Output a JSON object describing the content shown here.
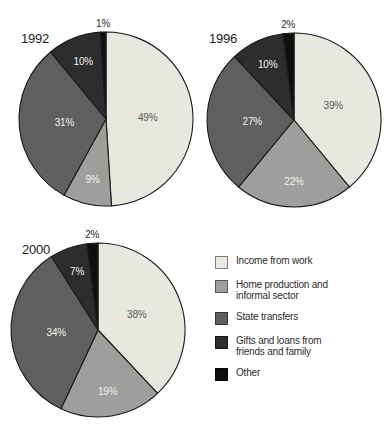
{
  "palette": [
    "#e9e8e0",
    "#9e9e9c",
    "#5f5f5f",
    "#2d2d2d",
    "#0f0f0f"
  ],
  "slice_label_colors": [
    "#59595b",
    "#f2f2ec",
    "#f2f2ec",
    "#f2f2ec",
    "#2b2b2b"
  ],
  "chart_data": [
    {
      "type": "pie",
      "title": "1992",
      "categories": [
        "Income from work",
        "Home production and informal sector",
        "State transfers",
        "Gifts and loans from friends and family",
        "Other"
      ],
      "values": [
        49,
        9,
        31,
        10,
        1
      ],
      "unit": "%",
      "labels": [
        "49%",
        "9%",
        "31%",
        "10%",
        "1%"
      ],
      "start_angle_deg": -90,
      "direction": "clockwise"
    },
    {
      "type": "pie",
      "title": "1996",
      "categories": [
        "Income from work",
        "Home production and informal sector",
        "State transfers",
        "Gifts and loans from friends and family",
        "Other"
      ],
      "values": [
        39,
        22,
        27,
        10,
        2
      ],
      "unit": "%",
      "labels": [
        "39%",
        "22%",
        "27%",
        "10%",
        "2%"
      ],
      "start_angle_deg": -90,
      "direction": "clockwise"
    },
    {
      "type": "pie",
      "title": "2000",
      "categories": [
        "Income from work",
        "Home production and informal sector",
        "State transfers",
        "Gifts and loans from friends and family",
        "Other"
      ],
      "values": [
        38,
        19,
        34,
        7,
        2
      ],
      "unit": "%",
      "labels": [
        "38%",
        "19%",
        "34%",
        "7%",
        "2%"
      ],
      "start_angle_deg": -90,
      "direction": "clockwise"
    }
  ],
  "legend": {
    "position": "bottom-right",
    "items": [
      {
        "label": "Income from work",
        "color": "#e9e8e0"
      },
      {
        "label": "Home production and informal sector",
        "color": "#9e9e9c"
      },
      {
        "label": "State transfers",
        "color": "#5f5f5f"
      },
      {
        "label": "Gifts and loans from friends and family",
        "color": "#2d2d2d"
      },
      {
        "label": "Other",
        "color": "#0f0f0f"
      }
    ]
  }
}
